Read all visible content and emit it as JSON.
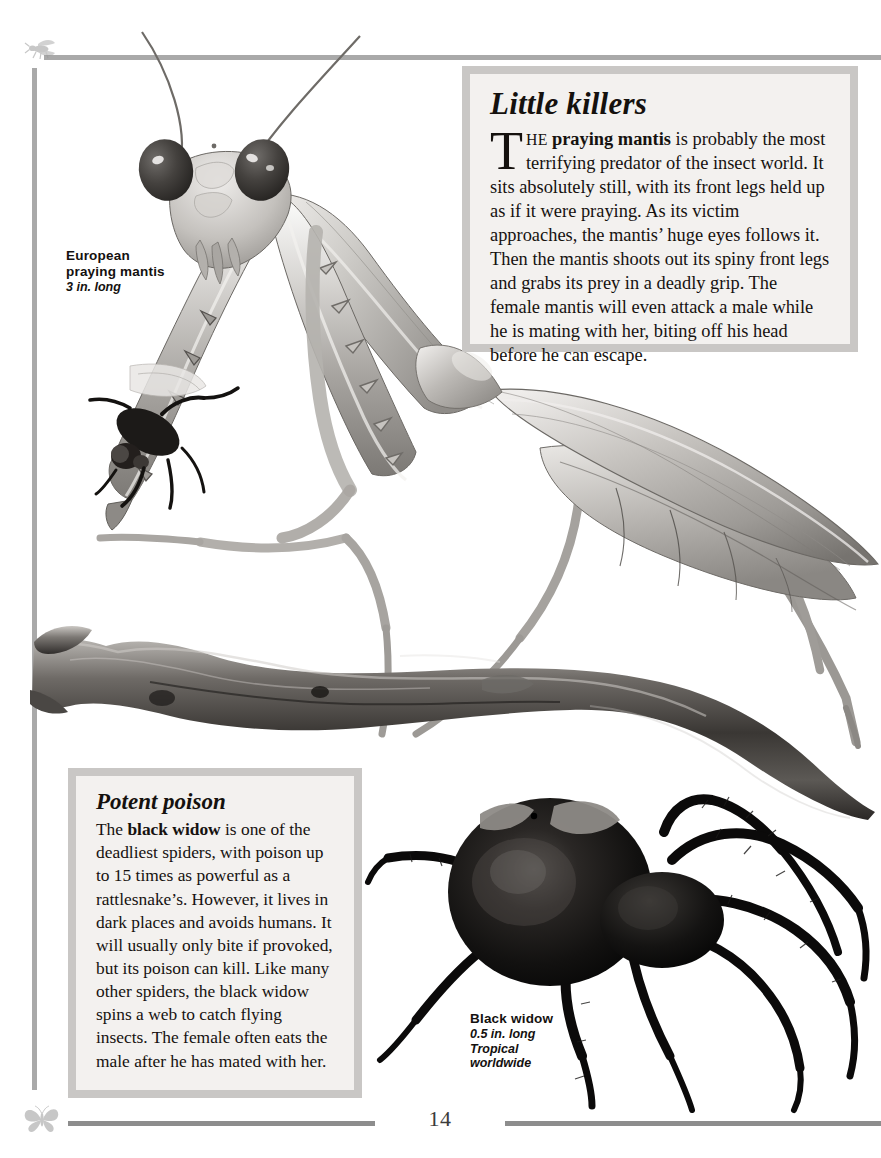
{
  "page": {
    "number": "14",
    "background": "#ffffff",
    "rule_color": "#a9a9a9",
    "corner_icons": [
      "fly-icon",
      "butterfly-icon"
    ]
  },
  "panels": [
    {
      "id": "killers",
      "title": "Little killers",
      "dropcap": "T",
      "lead_smallcaps": "HE ",
      "lead_bold": "praying mantis",
      "body": " is probably the most terrifying predator of the insect world. It sits absolutely still, with its front legs held up as if it were praying. As its victim approaches, the mantis’ huge eyes follows it. Then the mantis shoots out its spiny front legs and grabs its prey in a deadly grip. The female mantis will even attack a male while he is mating with her, biting off his head before he can escape.",
      "frame_color": "#c9c7c5",
      "fill_color": "#f3f1ef"
    },
    {
      "id": "poison",
      "title": "Potent poison",
      "body_lead": "The ",
      "body_bold": "black widow",
      "body": " is one of the deadliest spiders, with poison up to 15 times as powerful as a rattlesnake’s. However, it lives in dark places and avoids humans. It will usually only bite if provoked, but its poison can kill. Like many other spiders, the black widow spins a web to catch flying insects. The female often eats the male after he has mated with her.",
      "frame_color": "#c9c7c5",
      "fill_color": "#f3f1ef"
    }
  ],
  "captions": {
    "mantis": {
      "name_line1": "European",
      "name_line2": "praying mantis",
      "meta1": "3 in. long",
      "meta2": "",
      "meta3": ""
    },
    "spider": {
      "name_line1": "Black widow",
      "name_line2": "",
      "meta1": "0.5 in. long",
      "meta2": "Tropical",
      "meta3": "worldwide"
    }
  },
  "illustrations": [
    {
      "name": "praying-mantis-illustration",
      "subject": "European praying mantis holding a fly"
    },
    {
      "name": "branch-illustration",
      "subject": "dead tree branch"
    },
    {
      "name": "black-widow-illustration",
      "subject": "black widow spider"
    },
    {
      "name": "fly-prey-illustration",
      "subject": "fly caught in mantis forelegs"
    }
  ]
}
